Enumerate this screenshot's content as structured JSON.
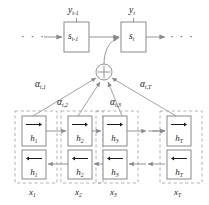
{
  "figure": {
    "name": "bidirectional-rnn-attention-diagram",
    "type": "diagram",
    "width": 209,
    "height": 205,
    "colors": {
      "background": "#ffffff",
      "stroke": "#8a8a8a",
      "box_stroke": "#7d7d7d",
      "dashed_group": "#a9a9a9",
      "text": "#1b1b1b",
      "arrow": "#8a8a8a"
    }
  },
  "decoder": {
    "outputs": [
      {
        "name": "y-prev",
        "label": "y",
        "sub": "t-1"
      },
      {
        "name": "y-curr",
        "label": "y",
        "sub": "t"
      }
    ],
    "states": [
      {
        "name": "s-prev",
        "label": "s",
        "sub": "t-1"
      },
      {
        "name": "s-curr",
        "label": "s",
        "sub": "t"
      }
    ],
    "ellipsis_left": "· · ·",
    "ellipsis_right": "· · ·"
  },
  "sum_node": {
    "name": "context-sum-node",
    "symbol": "+",
    "description": "circled-plus weighted sum"
  },
  "attention_weights": [
    {
      "name": "alpha-t-1",
      "label": "α",
      "sub": "t,1"
    },
    {
      "name": "alpha-t-2",
      "label": "α",
      "sub": "t,2"
    },
    {
      "name": "alpha-t-3",
      "label": "α",
      "sub": "t,3"
    },
    {
      "name": "alpha-t-T",
      "label": "α",
      "sub": "t,T"
    }
  ],
  "encoder": {
    "columns": [
      {
        "name": "encoder-column-1",
        "input": {
          "label": "x",
          "sub": "1"
        },
        "forward": {
          "label": "h",
          "sub": "1",
          "direction": "right"
        },
        "backward": {
          "label": "h",
          "sub": "1",
          "direction": "left"
        }
      },
      {
        "name": "encoder-column-2",
        "input": {
          "label": "x",
          "sub": "2"
        },
        "forward": {
          "label": "h",
          "sub": "2",
          "direction": "right"
        },
        "backward": {
          "label": "h",
          "sub": "2",
          "direction": "left"
        }
      },
      {
        "name": "encoder-column-3",
        "input": {
          "label": "x",
          "sub": "3"
        },
        "forward": {
          "label": "h",
          "sub": "3",
          "direction": "right"
        },
        "backward": {
          "label": "h",
          "sub": "3",
          "direction": "left"
        }
      },
      {
        "name": "encoder-column-T",
        "input": {
          "label": "x",
          "sub": "T"
        },
        "forward": {
          "label": "h",
          "sub": "T",
          "direction": "right"
        },
        "backward": {
          "label": "h",
          "sub": "T",
          "direction": "left"
        }
      }
    ]
  }
}
